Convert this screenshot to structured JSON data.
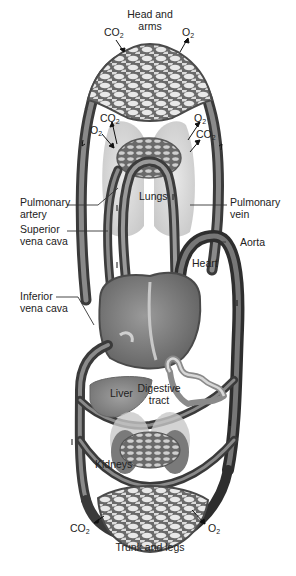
{
  "diagram": {
    "regions": {
      "head_arms": {
        "line1": "Head and",
        "line2": "arms"
      },
      "lungs": "Lungs",
      "heart": "Heart",
      "liver": "Liver",
      "digestive": {
        "line1": "Digestive",
        "line2": "tract"
      },
      "kidneys": "Kidneys",
      "trunk_legs": "Trunk and legs"
    },
    "vessels": {
      "pulmonary_artery": {
        "line1": "Pulmonary",
        "line2": "artery"
      },
      "pulmonary_vein": {
        "line1": "Pulmonary",
        "line2": "vein"
      },
      "superior_vena_cava": {
        "line1": "Superior",
        "line2": "vena cava"
      },
      "inferior_vena_cava": {
        "line1": "Inferior",
        "line2": "vena cava"
      },
      "aorta": "Aorta"
    },
    "gases": {
      "co2_main": "CO",
      "co2_sub": "2",
      "o2_main": "O",
      "o2_sub": "2"
    },
    "colors": {
      "vessel_dark": "#3c3c3c",
      "vessel_mid": "#6e6e6e",
      "vessel_light": "#9a9a9a",
      "organ_fill": "#8a8a8a",
      "lung_fill": "#d6d6d6",
      "background": "#ffffff",
      "text": "#222222"
    }
  }
}
